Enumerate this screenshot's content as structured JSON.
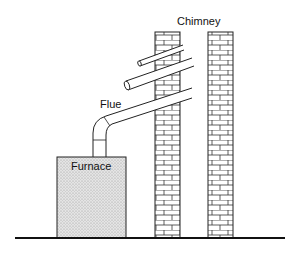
{
  "labels": {
    "chimney": "Chimney",
    "flue": "Flue",
    "furnace": "Furnace"
  },
  "colors": {
    "line": "#222222",
    "brick_mortar": "#ffffff",
    "brick_line": "#333333",
    "furnace_fill": "#dcdcdc",
    "background": "#ffffff"
  },
  "components": [
    {
      "name": "ground-line",
      "description": "Horizontal ground line"
    },
    {
      "name": "furnace",
      "description": "Stippled box on ground"
    },
    {
      "name": "flue",
      "description": "Pipe rising from furnace with elbow, angled up into chimney"
    },
    {
      "name": "chimney-left-wall",
      "description": "Brick column"
    },
    {
      "name": "chimney-right-wall",
      "description": "Brick column"
    },
    {
      "name": "upper-pipe-1",
      "description": "Angled pipe entering chimney"
    },
    {
      "name": "upper-pipe-2",
      "description": "Smaller angled pipe entering chimney"
    }
  ]
}
